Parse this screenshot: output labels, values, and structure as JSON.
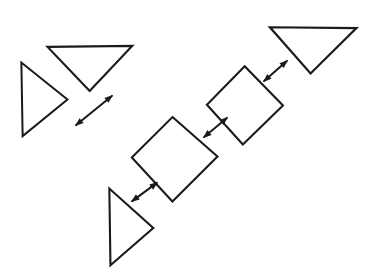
{
  "canvas": {
    "width": 374,
    "height": 280,
    "background_color": "#ffffff",
    "ink_color": "#1a1a1a",
    "style": "hand-drawn line diagram"
  },
  "diagram": {
    "shapes": [
      {
        "id": "triangle-lower-left",
        "name": "right-pointing-triangle",
        "kind": "triangle",
        "orientation": "points-right",
        "points": "110,189 110,266 153,228",
        "stroke_width": 2.1
      },
      {
        "id": "triangle-mid-left",
        "name": "right-pointing-triangle",
        "kind": "triangle",
        "orientation": "points-right",
        "points": "22,63 22,137 68,100",
        "stroke_width": 2.0
      },
      {
        "id": "triangle-top-left",
        "name": "down-pointing-triangle",
        "kind": "triangle",
        "orientation": "points-down",
        "points": "48,46 133,46 90,90",
        "stroke_width": 2.2
      },
      {
        "id": "square-lower",
        "name": "rotated-square",
        "kind": "square",
        "orientation": "rotated-45-diamond",
        "points": "173,118 217,157 173,202 131,158",
        "stroke_width": 2.1
      },
      {
        "id": "square-upper",
        "name": "rotated-square",
        "kind": "square",
        "orientation": "rotated-45-diamond",
        "points": "245,67 282,105 243,145 206,105",
        "stroke_width": 2.1
      },
      {
        "id": "triangle-top-right",
        "name": "down-pointing-triangle",
        "kind": "triangle",
        "orientation": "points-down",
        "points": "270,28 357,28 311,73",
        "stroke_width": 2.2
      }
    ],
    "arrows": [
      {
        "id": "arrow-triangle-to-square-lower",
        "name": "double-headed-arrow",
        "from": "triangle-lower-left",
        "to": "square-lower",
        "x1": 131,
        "y1": 202,
        "x2": 158,
        "y2": 182,
        "heads": "both",
        "direction": "up-right / down-left",
        "stroke_width": 2.0
      },
      {
        "id": "arrow-square-lower-to-square-upper",
        "name": "double-headed-arrow",
        "from": "square-lower",
        "to": "square-upper",
        "x1": 203,
        "y1": 138,
        "x2": 228,
        "y2": 117,
        "heads": "both",
        "direction": "up-right / down-left",
        "stroke_width": 2.0
      },
      {
        "id": "arrow-square-upper-to-triangle-top-right",
        "name": "double-headed-arrow",
        "from": "square-upper",
        "to": "triangle-top-right",
        "x1": 263,
        "y1": 82,
        "x2": 288,
        "y2": 60,
        "heads": "both",
        "direction": "up-right / down-left",
        "stroke_width": 2.0
      },
      {
        "id": "arrow-triangle-mid-to-triangle-top-left",
        "name": "double-headed-arrow",
        "from": "triangle-mid-left",
        "to": "triangle-top-left",
        "x1": 75,
        "y1": 126,
        "x2": 113,
        "y2": 95,
        "heads": "both",
        "direction": "up-right / down-left",
        "stroke_width": 2.0
      }
    ]
  }
}
